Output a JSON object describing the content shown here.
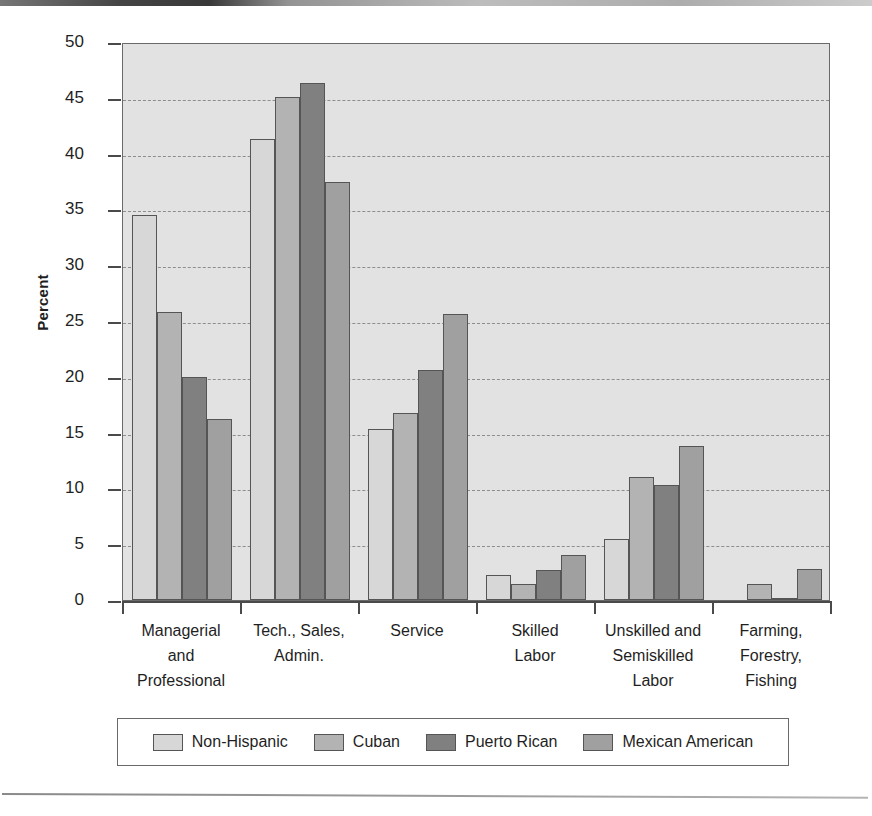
{
  "figure": {
    "ylabel": "Percent"
  },
  "chart_data": {
    "type": "bar",
    "title": "",
    "subtitle": "",
    "xlabel": "",
    "ylabel": "Percent",
    "ylim": [
      0,
      50
    ],
    "yticks": [
      0,
      5,
      10,
      15,
      20,
      25,
      30,
      35,
      40,
      45,
      50
    ],
    "ytick_labels": [
      "0",
      "5",
      "10",
      "15",
      "20",
      "25",
      "30",
      "35",
      "40",
      "45",
      "50"
    ],
    "grid": "horizontal-dashed",
    "legend_position": "bottom",
    "categories": [
      "Managerial and Professional",
      "Tech., Sales, Admin.",
      "Service",
      "Skilled Labor",
      "Unskilled and Semiskilled Labor",
      "Farming, Forestry, Fishing"
    ],
    "category_lines": [
      [
        "Managerial",
        "and",
        "Professional"
      ],
      [
        "Tech., Sales,",
        "Admin."
      ],
      [
        "Service"
      ],
      [
        "Skilled",
        "Labor"
      ],
      [
        "Unskilled and",
        "Semiskilled",
        "Labor"
      ],
      [
        "Farming,",
        "Forestry,",
        "Fishing"
      ]
    ],
    "series": [
      {
        "name": "Non-Hispanic",
        "color": "#d7d7d7",
        "values": [
          34.5,
          41.3,
          15.3,
          2.2,
          5.5,
          0.0
        ]
      },
      {
        "name": "Cuban",
        "color": "#b3b3b3",
        "values": [
          25.8,
          45.1,
          16.8,
          1.4,
          11.0,
          1.4
        ]
      },
      {
        "name": "Puerto Rican",
        "color": "#808080",
        "values": [
          20.0,
          46.3,
          20.6,
          2.7,
          10.3,
          0.2
        ]
      },
      {
        "name": "Mexican American",
        "color": "#a0a0a0",
        "values": [
          16.2,
          37.5,
          25.6,
          4.0,
          13.8,
          2.8
        ]
      }
    ]
  },
  "legend": {
    "items": [
      {
        "label": "Non-Hispanic",
        "color": "#d7d7d7"
      },
      {
        "label": "Cuban",
        "color": "#b3b3b3"
      },
      {
        "label": "Puerto Rican",
        "color": "#808080"
      },
      {
        "label": "Mexican American",
        "color": "#a0a0a0"
      }
    ]
  },
  "colors": {
    "plot_background": "#e2e2e2",
    "axis": "#4a4a4a",
    "gridline": "#8d8d8d",
    "bar_outline": "#555555",
    "text": "#1f1f1f"
  }
}
